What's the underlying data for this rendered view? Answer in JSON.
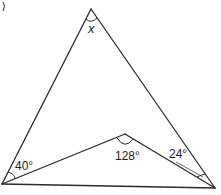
{
  "diagram": {
    "type": "geometry-figure",
    "colors": {
      "stroke": "#2a2a2a",
      "background": "#ffffff"
    },
    "vertices": {
      "apex": {
        "x": 91,
        "y": 9
      },
      "bottom_left": {
        "x": 2,
        "y": 184
      },
      "bottom_right": {
        "x": 215,
        "y": 188
      },
      "interior": {
        "x": 125,
        "y": 134
      }
    },
    "labels": {
      "apex_angle": "x",
      "bottom_left_angle": "40°",
      "interior_angle": "128°",
      "bottom_right_angle": "24°"
    },
    "corner_mark": ")"
  }
}
